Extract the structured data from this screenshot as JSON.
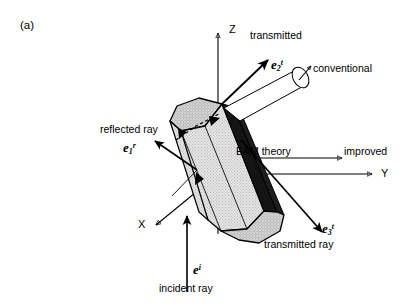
{
  "figure": {
    "panel_label": "(a)",
    "background_color": "#ffffff",
    "line_color": "#000000",
    "crystal_face_light": "#dcdcdc",
    "crystal_face_mid": "#c9c9c9",
    "crystal_face_dark": "#141414"
  },
  "axes": [
    {
      "name": "z-axis",
      "label": "Z",
      "direction": "up",
      "x1": 218,
      "y1": 232,
      "x2": 218,
      "y2": 30
    },
    {
      "name": "y-axis",
      "label": "Y",
      "direction": "right",
      "x1": 218,
      "y1": 174,
      "x2": 378,
      "y2": 174
    },
    {
      "name": "x-axis",
      "label": "X",
      "direction": "down-left",
      "x1": 218,
      "y1": 174,
      "x2": 152,
      "y2": 228
    }
  ],
  "rays": [
    {
      "name": "incident-ray",
      "label": "incident ray",
      "symbol_base": "e",
      "symbol_sup": "i",
      "symbol_sub": "",
      "description": "vertical beam entering the crystal from below"
    },
    {
      "name": "reflected-ray",
      "label": "reflected ray",
      "symbol_base": "e",
      "symbol_sup": "r",
      "symbol_sub": "1",
      "description": "externally reflected beam leaving to upper-left"
    },
    {
      "name": "transmitted-ray-2",
      "label": "transmitted",
      "symbol_base": "e",
      "symbol_sup": "t",
      "symbol_sub": "2",
      "description": "beam transmitted to upper-right"
    },
    {
      "name": "transmitted-ray-3",
      "label": "transmitted ray",
      "symbol_base": "e",
      "symbol_sup": "t",
      "symbol_sub": "3",
      "description": "beam transmitted to lower-right"
    }
  ],
  "annotations": [
    {
      "name": "conventional-label",
      "label": "conventional"
    },
    {
      "name": "em-theory-label",
      "label": "E&M theory"
    },
    {
      "name": "improved-label",
      "label": "improved"
    }
  ],
  "crystal": {
    "name": "hexagonal-ice-crystal",
    "shape": "hexagonal column",
    "internal_path": "dashed internal ray with refraction arrowheads"
  }
}
